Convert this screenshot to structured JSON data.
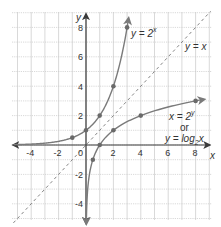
{
  "chart_data": {
    "type": "line",
    "title": "",
    "xlabel": "x",
    "ylabel": "y",
    "xlim": [
      -5,
      9
    ],
    "ylim": [
      -5,
      9
    ],
    "grid": true,
    "x_ticks": [
      "-4",
      "-2",
      "0",
      "2",
      "4",
      "6",
      "8"
    ],
    "y_ticks": [
      "8",
      "6",
      "4",
      "2",
      "-2",
      "-4"
    ],
    "series": [
      {
        "name": "y = 2^x",
        "label": "y = 2",
        "label_sup": "x",
        "style": "solid",
        "points": [
          [
            -1,
            0.5
          ],
          [
            0,
            1
          ],
          [
            1,
            2
          ],
          [
            2,
            4
          ],
          [
            3,
            8
          ]
        ]
      },
      {
        "name": "y = x",
        "label": "y = x",
        "style": "dashed",
        "points": [
          [
            -5,
            -5
          ],
          [
            9,
            9
          ]
        ]
      },
      {
        "name": "x = 2^y or y = log2 x",
        "label_line1": "x = 2",
        "label_line1_sup": "y",
        "label_line2": "or",
        "label_line3": "y = log",
        "label_line3_sub": "2",
        "label_line3_end": "x",
        "style": "solid",
        "points": [
          [
            0.5,
            -1
          ],
          [
            1,
            0
          ],
          [
            2,
            1
          ],
          [
            4,
            2
          ],
          [
            8,
            3
          ]
        ]
      }
    ],
    "legend": "inline labels"
  },
  "colors": {
    "axis": "#3a3a3a",
    "curve": "#7a7a7a",
    "grid": "#c8c8c8",
    "point": "#6a6a6a"
  }
}
